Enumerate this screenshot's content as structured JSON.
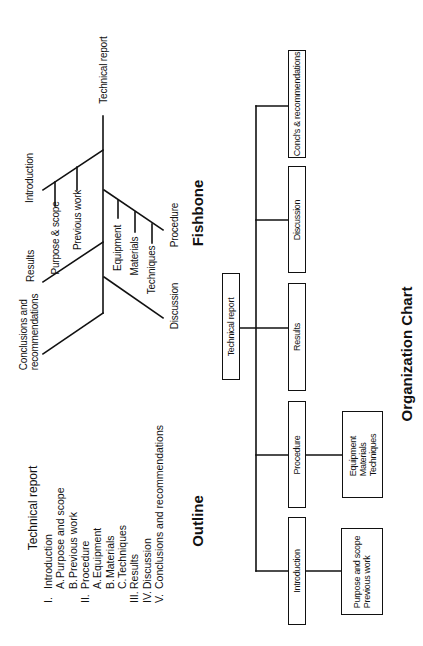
{
  "fishbone": {
    "title": "Fishbone",
    "root": "Technical report",
    "branches": [
      {
        "label": "Introduction",
        "children": [
          "Purpose & scope",
          "Previous work"
        ]
      },
      {
        "label": "Procedure",
        "children": [
          "Equipment",
          "Materials",
          "Techniques"
        ]
      },
      {
        "label": "Results",
        "children": []
      },
      {
        "label": "Discussion",
        "children": []
      },
      {
        "label": "Conclusions and recommendations",
        "lines": [
          "Conclusions and",
          "recommendations"
        ],
        "children": []
      }
    ]
  },
  "outline": {
    "title": "Outline",
    "heading": "Technical report",
    "items": [
      {
        "num": "I.",
        "text": "Introduction",
        "subitems": [
          {
            "letter": "A.",
            "text": "Purpose and scope"
          },
          {
            "letter": "B.",
            "text": "Previous work"
          }
        ]
      },
      {
        "num": "II.",
        "text": "Procedure",
        "subitems": [
          {
            "letter": "A.",
            "text": "Equipment"
          },
          {
            "letter": "B.",
            "text": "Materials"
          },
          {
            "letter": "C.",
            "text": "Techniques"
          }
        ]
      },
      {
        "num": "III.",
        "text": "Results",
        "subitems": []
      },
      {
        "num": "IV.",
        "text": "Discussion",
        "subitems": []
      },
      {
        "num": "V.",
        "text": "Conclusions and recommendations",
        "subitems": []
      }
    ]
  },
  "org_chart": {
    "title": "Organization Chart",
    "root": "Technical report",
    "children": [
      {
        "label": "Introduction",
        "details": [
          "Purpose and scope",
          "Previous work"
        ]
      },
      {
        "label": "Procedure",
        "details": [
          "Equipment",
          "Materials",
          "Techniques"
        ]
      },
      {
        "label": "Results",
        "details": []
      },
      {
        "label": "Discussion",
        "details": []
      },
      {
        "label": "Concl's & recommendations",
        "details": []
      }
    ]
  },
  "colors": {
    "ink": "#111111",
    "paper": "#ffffff"
  }
}
